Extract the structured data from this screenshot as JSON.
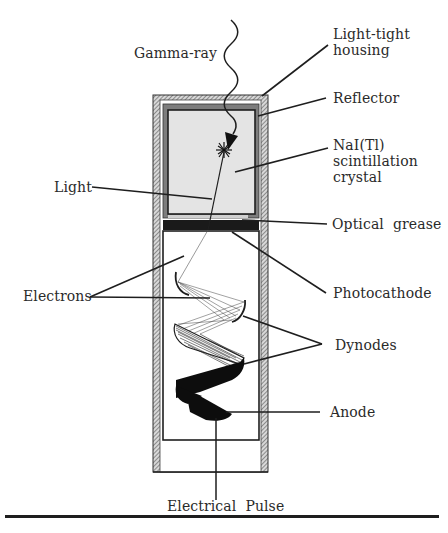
{
  "diagram": {
    "title_hidden": "Scintillation detector with photomultiplier tube",
    "labels": {
      "gamma_ray": "Gamma-ray",
      "housing_line1": "Light-tight",
      "housing_line2": "housing",
      "reflector": "Reflector",
      "crystal_line1": "NaI(Tl)",
      "crystal_line2": "scintillation",
      "crystal_line3": "crystal",
      "light": "Light",
      "optical_grease": "Optical  grease",
      "electrons": "Electrons",
      "photocathode": "Photocathode",
      "dynodes": "Dynodes",
      "anode": "Anode",
      "electrical_pulse": "Electrical  Pulse"
    },
    "colors": {
      "housing_hatch": "#9a9a9a",
      "reflector": "#7d7d7d",
      "crystal_fill": "#e4e4e4",
      "photocathode": "#1a1a1a",
      "line": "#1e1e1e"
    }
  }
}
